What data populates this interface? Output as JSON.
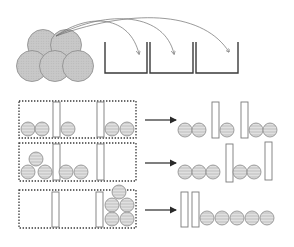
{
  "diagram": {
    "colors": {
      "ball_fill": "#cfcfcf",
      "ball_stroke": "#8a8a8a",
      "ball_stripe": "#e4e4e4",
      "bin_stroke": "#3a3a3a",
      "arrow": "#6e6e6e",
      "bar_stroke": "#7a7a7a",
      "bar_fill": "#ffffff",
      "dotted_box": "#3a3a3a",
      "row_arrow": "#2a2a2a"
    },
    "top": {
      "pile": {
        "ball_radius": 15.5,
        "balls": [
          {
            "cx": 43,
            "cy": 45
          },
          {
            "cx": 66,
            "cy": 45
          },
          {
            "cx": 32,
            "cy": 66
          },
          {
            "cx": 55,
            "cy": 66
          },
          {
            "cx": 78,
            "cy": 66
          }
        ]
      },
      "bins": [
        {
          "x1": 105,
          "x2": 147,
          "top": 42,
          "bottom": 73
        },
        {
          "x1": 150,
          "x2": 193,
          "top": 42,
          "bottom": 73
        },
        {
          "x1": 196,
          "x2": 238,
          "top": 42,
          "bottom": 73
        }
      ],
      "arrows": [
        {
          "path": "M56,36 C90,12 130,16 139,54"
        },
        {
          "path": "M56,36 C110,8 165,14 174,54"
        },
        {
          "path": "M56,36 C140,6 205,14 229,52"
        }
      ]
    },
    "rows": [
      {
        "label": "arrangement-1",
        "box": {
          "x": 19,
          "y": 101,
          "w": 117,
          "h": 37
        },
        "left_items": [
          {
            "type": "ball",
            "cx": 28,
            "cy": 129
          },
          {
            "type": "ball",
            "cx": 42,
            "cy": 129
          },
          {
            "type": "bar",
            "x": 53,
            "y": 102,
            "w": 7,
            "h": 35
          },
          {
            "type": "ball",
            "cx": 68,
            "cy": 129
          },
          {
            "type": "bar",
            "x": 97,
            "y": 102,
            "w": 7,
            "h": 35
          },
          {
            "type": "ball",
            "cx": 112,
            "cy": 129
          },
          {
            "type": "ball",
            "cx": 127,
            "cy": 129
          }
        ],
        "arrow": {
          "x1": 145,
          "x2": 176,
          "y": 120
        },
        "right_items": [
          {
            "type": "ball",
            "cx": 185,
            "cy": 130
          },
          {
            "type": "ball",
            "cx": 199,
            "cy": 130
          },
          {
            "type": "bar",
            "x": 212,
            "y": 102,
            "w": 7,
            "h": 36
          },
          {
            "type": "ball",
            "cx": 227,
            "cy": 130
          },
          {
            "type": "bar",
            "x": 241,
            "y": 102,
            "w": 7,
            "h": 36
          },
          {
            "type": "ball",
            "cx": 256,
            "cy": 130
          },
          {
            "type": "ball",
            "cx": 270,
            "cy": 130
          }
        ]
      },
      {
        "label": "arrangement-2",
        "box": {
          "x": 19,
          "y": 143,
          "w": 117,
          "h": 38
        },
        "left_items": [
          {
            "type": "ball",
            "cx": 36,
            "cy": 159
          },
          {
            "type": "ball",
            "cx": 28,
            "cy": 172
          },
          {
            "type": "ball",
            "cx": 45,
            "cy": 172
          },
          {
            "type": "bar",
            "x": 53,
            "y": 144,
            "w": 7,
            "h": 36
          },
          {
            "type": "ball",
            "cx": 66,
            "cy": 172
          },
          {
            "type": "ball",
            "cx": 81,
            "cy": 172
          },
          {
            "type": "bar",
            "x": 97,
            "y": 144,
            "w": 7,
            "h": 36
          }
        ],
        "arrow": {
          "x1": 145,
          "x2": 176,
          "y": 163
        },
        "right_items": [
          {
            "type": "ball",
            "cx": 185,
            "cy": 172
          },
          {
            "type": "ball",
            "cx": 199,
            "cy": 172
          },
          {
            "type": "ball",
            "cx": 213,
            "cy": 172
          },
          {
            "type": "bar",
            "x": 226,
            "y": 144,
            "w": 7,
            "h": 38
          },
          {
            "type": "ball",
            "cx": 240,
            "cy": 172
          },
          {
            "type": "ball",
            "cx": 254,
            "cy": 172
          },
          {
            "type": "bar",
            "x": 265,
            "y": 142,
            "w": 7,
            "h": 38
          }
        ]
      },
      {
        "label": "arrangement-3",
        "box": {
          "x": 19,
          "y": 190,
          "w": 117,
          "h": 38
        },
        "left_items": [
          {
            "type": "bar",
            "x": 52,
            "y": 192,
            "w": 7,
            "h": 35
          },
          {
            "type": "bar",
            "x": 96,
            "y": 192,
            "w": 7,
            "h": 35
          },
          {
            "type": "ball",
            "cx": 119,
            "cy": 192
          },
          {
            "type": "ball",
            "cx": 112,
            "cy": 205
          },
          {
            "type": "ball",
            "cx": 127,
            "cy": 205
          },
          {
            "type": "ball",
            "cx": 112,
            "cy": 219
          },
          {
            "type": "ball",
            "cx": 127,
            "cy": 219
          }
        ],
        "arrow": {
          "x1": 145,
          "x2": 176,
          "y": 210
        },
        "right_items": [
          {
            "type": "bar",
            "x": 181,
            "y": 192,
            "w": 7,
            "h": 35
          },
          {
            "type": "bar",
            "x": 192,
            "y": 192,
            "w": 7,
            "h": 35
          },
          {
            "type": "ball",
            "cx": 207,
            "cy": 218
          },
          {
            "type": "ball",
            "cx": 222,
            "cy": 218
          },
          {
            "type": "ball",
            "cx": 237,
            "cy": 218
          },
          {
            "type": "ball",
            "cx": 252,
            "cy": 218
          },
          {
            "type": "ball",
            "cx": 267,
            "cy": 218
          }
        ]
      }
    ],
    "row_ball_radius": 7
  }
}
